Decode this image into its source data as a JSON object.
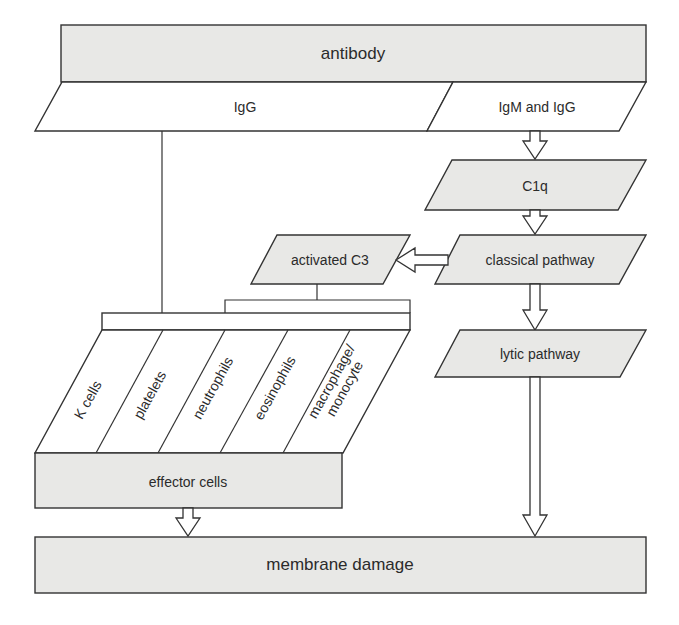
{
  "diagram": {
    "top": {
      "label": "antibody"
    },
    "branches": [
      {
        "id": "igg",
        "label": "IgG"
      },
      {
        "id": "igm_igg",
        "label": "IgM and IgG"
      }
    ],
    "nodes": {
      "c1q": {
        "label": "C1q"
      },
      "classical": {
        "label": "classical pathway"
      },
      "activated_c3": {
        "label": "activated C3"
      },
      "lytic": {
        "label": "lytic pathway"
      },
      "effector": {
        "label": "effector cells"
      },
      "membrane": {
        "label": "membrane damage"
      }
    },
    "cells": [
      {
        "label": "K cells"
      },
      {
        "label": "platelets"
      },
      {
        "label": "neutrophils"
      },
      {
        "label": "eosinophils"
      },
      {
        "label": "macrophage/\nmonocyte",
        "line1": "macrophage/",
        "line2": "monocyte"
      }
    ],
    "edges": [
      {
        "from": "IgM and IgG",
        "to": "C1q"
      },
      {
        "from": "C1q",
        "to": "classical pathway"
      },
      {
        "from": "classical pathway",
        "to": "activated C3"
      },
      {
        "from": "classical pathway",
        "to": "lytic pathway"
      },
      {
        "from": "IgG",
        "to": "effector cells"
      },
      {
        "from": "activated C3",
        "to": "effector cells"
      },
      {
        "from": "effector cells",
        "to": "membrane damage"
      },
      {
        "from": "lytic pathway",
        "to": "membrane damage"
      }
    ],
    "colors": {
      "fill": "#e8e8e6",
      "stroke": "#333333",
      "text": "#2b2b2b"
    }
  }
}
